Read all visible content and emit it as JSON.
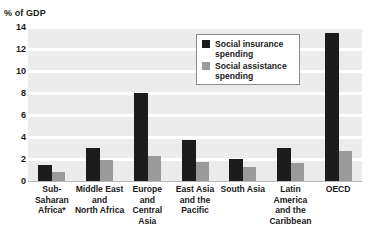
{
  "chart_data": {
    "type": "bar",
    "title": "",
    "subtitle": "",
    "xlabel": "",
    "ylabel": "% of GDP",
    "ylim": [
      0,
      14
    ],
    "yticks": [
      0,
      2,
      4,
      6,
      8,
      10,
      12,
      14
    ],
    "ytick_labels": [
      "0",
      "2",
      "4",
      "6",
      "8",
      "10",
      "12",
      "14"
    ],
    "grid": true,
    "legend_position": "upper-center",
    "categories": [
      "Sub-Saharan Africa*",
      "Middle East and North Africa",
      "Europe and Central Asia",
      "East Asia and the Pacific",
      "South Asia",
      "Latin America and the Caribbean",
      "OECD"
    ],
    "category_lines": [
      [
        "Sub-",
        "Saharan",
        "Africa*"
      ],
      [
        "Middle East",
        "and",
        "North Africa"
      ],
      [
        "Europe",
        "and",
        "Central",
        "Asia"
      ],
      [
        "East Asia",
        "and the",
        "Pacific"
      ],
      [
        "South Asia"
      ],
      [
        "Latin",
        "America",
        "and the",
        "Caribbean"
      ],
      [
        "OECD"
      ]
    ],
    "series": [
      {
        "name": "Social insurance spending",
        "color": "#1c1c1c",
        "values": [
          1.5,
          3.0,
          8.0,
          3.7,
          2.0,
          3.0,
          13.5
        ]
      },
      {
        "name": "Social assistance spending",
        "color": "#9a9a9a",
        "values": [
          0.8,
          1.9,
          2.3,
          1.7,
          1.3,
          1.6,
          2.7
        ]
      }
    ]
  },
  "axis": {
    "y_title": "% of GDP"
  },
  "legend": {
    "items": [
      {
        "label_line1": "Social insurance",
        "label_line2": "spending",
        "color": "#1c1c1c",
        "swatch": "insurance"
      },
      {
        "label_line1": "Social assistance",
        "label_line2": "spending",
        "color": "#9a9a9a",
        "swatch": "assistance"
      }
    ]
  },
  "style": {
    "plot_background": "#ececec",
    "gridline_color": "#ffffff",
    "page_background": "#ffffff",
    "text_color": "#1a1a1a"
  }
}
